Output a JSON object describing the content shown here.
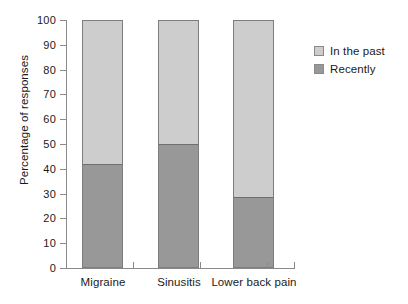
{
  "chart_data": {
    "type": "bar",
    "subtype": "stacked-percentage",
    "title": "",
    "xlabel": "",
    "ylabel": "Percentage of responses",
    "ylim": [
      0,
      100
    ],
    "yticks": [
      0,
      10,
      20,
      30,
      40,
      50,
      60,
      70,
      80,
      90,
      100
    ],
    "grid": false,
    "legend_position": "right",
    "categories": [
      "Migraine",
      "Sinusitis",
      "Lower back pain"
    ],
    "series": [
      {
        "name": "In the past",
        "color": "#cdcdcd",
        "values": [
          58,
          50,
          71.5
        ]
      },
      {
        "name": "Recently",
        "color": "#989898",
        "values": [
          42,
          50,
          28.5
        ]
      }
    ]
  },
  "axes": {
    "y_title": "Percentage of responses",
    "y_tick_labels": [
      "100",
      "90",
      "80",
      "70",
      "60",
      "50",
      "40",
      "30",
      "20",
      "10",
      "0"
    ],
    "x_tick_labels": [
      "Migraine",
      "Sinusitis",
      "Lower back pain"
    ]
  },
  "legend": {
    "entries": [
      {
        "label": "In the past",
        "color": "#cdcdcd"
      },
      {
        "label": "Recently",
        "color": "#989898"
      }
    ]
  },
  "colors": {
    "in_the_past": "#cdcdcd",
    "recently": "#989898",
    "axis": "#8a8a8a",
    "bar_border": "#7d7d7d",
    "text": "#1a1a1a",
    "background": "#ffffff"
  }
}
